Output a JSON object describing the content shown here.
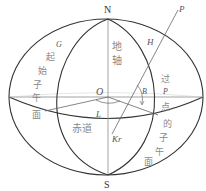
{
  "diagram": {
    "title": "",
    "colors": {
      "stroke_dark": "#333333",
      "stroke_light": "#999999",
      "text_cjk": "#888888",
      "background": "#ffffff"
    },
    "points": {
      "north": "N",
      "south": "S",
      "center": "O",
      "point_p": "P",
      "point_p_small": "P",
      "g": "G",
      "h": "H",
      "b": "B",
      "l": "L",
      "kr": "Kr"
    },
    "labels": {
      "earth_axis": [
        "地",
        "轴"
      ],
      "prime_meridian": [
        "起",
        "始",
        "子",
        "午",
        "面"
      ],
      "equator": "赤道",
      "meridian_through_p": [
        "过",
        "点",
        "的",
        "子",
        "午",
        "面"
      ]
    }
  }
}
